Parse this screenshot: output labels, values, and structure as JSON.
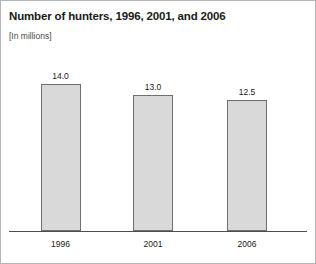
{
  "chart": {
    "title": "Number of hunters, 1996, 2001, and 2006",
    "subtitle": "[In millions]"
  },
  "chart_data": {
    "type": "bar",
    "title": "Number of hunters, 1996, 2001, and 2006",
    "subtitle": "[In millions]",
    "xlabel": "",
    "ylabel": "",
    "unit": "millions",
    "categories": [
      "1996",
      "2001",
      "2006"
    ],
    "values": [
      14.0,
      13.0,
      12.5
    ],
    "value_labels": [
      "14.0",
      "13.0",
      "12.5"
    ],
    "ylim": [
      0,
      16.2
    ],
    "grid": false,
    "legend": false,
    "bar_fill_color": "#d9d9d9",
    "bar_border_color": "#6f6f6f",
    "axis_color": "#4d4d4d",
    "frame_color": "#b6b6b6",
    "text_color": "#1a1a1a"
  }
}
